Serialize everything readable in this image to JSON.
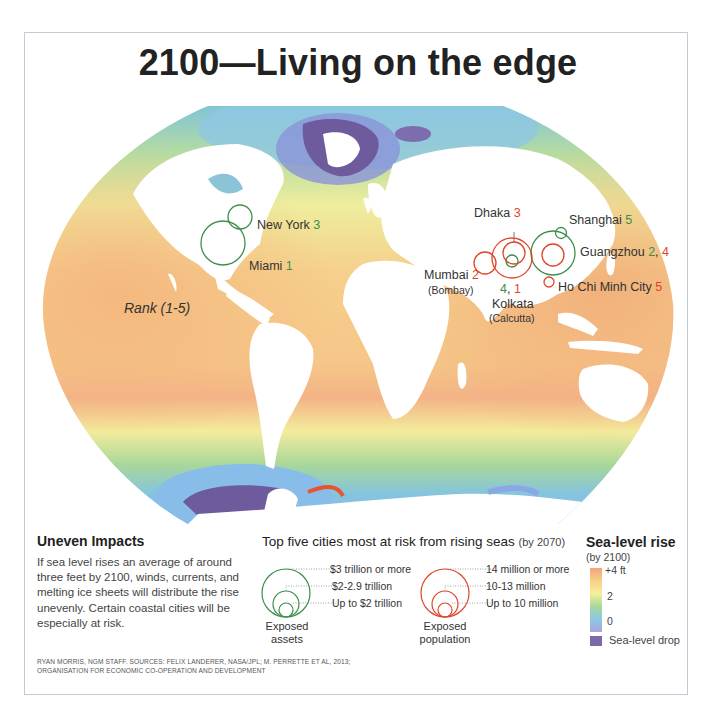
{
  "title": "2100—Living on the edge",
  "map": {
    "rank_label": "Rank (1-5)",
    "colors": {
      "assets": "#3e8e4a",
      "population": "#e0462a",
      "sea_drop": "#7b6aa8"
    },
    "cities": [
      {
        "name": "New York",
        "rank_assets": "3",
        "rank_population": null
      },
      {
        "name": "Miami",
        "rank_assets": "1",
        "rank_population": null
      },
      {
        "name": "Dhaka",
        "rank_assets": null,
        "rank_population": "3"
      },
      {
        "name": "Mumbai",
        "alt": "(Bombay)",
        "rank_assets": null,
        "rank_population": "2"
      },
      {
        "name": "Kolkata",
        "alt": "(Calcutta)",
        "rank_assets": "4",
        "rank_population": "1",
        "rank_text": "4, 1"
      },
      {
        "name": "Shanghai",
        "rank_assets": "5",
        "rank_population": null
      },
      {
        "name": "Guangzhou",
        "rank_assets": "2",
        "rank_population": "4"
      },
      {
        "name": "Ho Chi Minh City",
        "rank_assets": null,
        "rank_population": "5"
      }
    ]
  },
  "impacts": {
    "heading": "Uneven Impacts",
    "body": "If sea level rises an average of around three feet by 2100, winds, currents, and melting ice sheets will distribute the rise unevenly. Certain coastal cities will be especially at risk."
  },
  "top5": {
    "heading": "Top five cities most at risk from rising seas",
    "heading_suffix": "(by 2070)",
    "assets": {
      "caption_1": "Exposed",
      "caption_2": "assets",
      "levels": [
        "$3 trillion or more",
        "$2-2.9 trillion",
        "Up to $2 trillion"
      ]
    },
    "population": {
      "caption_1": "Exposed",
      "caption_2": "population",
      "levels": [
        "14 million or more",
        "10-13 million",
        "Up to 10 million"
      ]
    }
  },
  "sea_level": {
    "heading": "Sea-level rise",
    "subheading": "(by 2100)",
    "ticks": [
      "+4 ft",
      "2",
      "0"
    ],
    "drop_label": "Sea-level drop"
  },
  "credit": {
    "line1": "RYAN MORRIS, NGM STAFF. SOURCES: FELIX LANDERER, NASA/JPL; M. PERRETTE ET AL, 2013;",
    "line2": "ORGANISATION FOR ECONOMIC CO-OPERATION AND DEVELOPMENT"
  }
}
